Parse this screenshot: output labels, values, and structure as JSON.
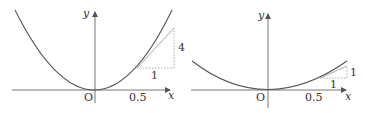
{
  "panels": [
    {
      "name": "left",
      "y_label": "y",
      "x_label": "x",
      "origin_label": "O",
      "tick_label": "0.5",
      "run_label": "1",
      "rise_label": "4"
    },
    {
      "name": "right",
      "y_label": "y",
      "x_label": "x",
      "origin_label": "O",
      "tick_label": "0.5",
      "run_label": "1",
      "rise_label": "1"
    }
  ],
  "colors": {
    "curve": "#555555",
    "axis": "#777777",
    "tangent": "#aaaaaa",
    "dotted": "#999999",
    "text": "#333333"
  }
}
